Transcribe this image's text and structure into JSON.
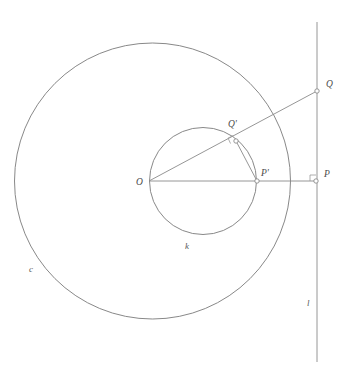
{
  "figure": {
    "background_color": "#ffffff",
    "stroke_color": "#7a7a7a",
    "label_color": "#4a4a4a",
    "width": 345,
    "height": 384
  },
  "labels": {
    "center": "O",
    "p_prime": "P'",
    "p": "P",
    "q_prime": "Q'",
    "q": "Q",
    "circle_c": "c",
    "circle_k": "k",
    "line_l": "l"
  },
  "geometry": {
    "circle_c": {
      "cx": 152.5,
      "cy": 181,
      "r": 138,
      "label": "c",
      "label_x": 29,
      "label_y": 272
    },
    "circle_k": {
      "cx": 203,
      "cy": 181,
      "r": 53.5,
      "label": "k",
      "label_x": 185,
      "label_y": 249
    },
    "line_l": {
      "x": 317,
      "y1": 22,
      "y2": 362,
      "label": "l",
      "label_x": 307,
      "label_y": 306
    },
    "points": [
      {
        "name": "O",
        "x": 149,
        "y": 181,
        "label": "O",
        "label_x": 136,
        "label_y": 185,
        "marker": "vertex"
      },
      {
        "name": "P'",
        "x": 257,
        "y": 181,
        "label": "P'",
        "label_x": 261,
        "label_y": 176,
        "marker": "open"
      },
      {
        "name": "P",
        "x": 316,
        "y": 181,
        "label": "P",
        "label_x": 324,
        "label_y": 177,
        "marker": "open"
      },
      {
        "name": "Q'",
        "x": 236,
        "y": 141,
        "label": "Q'",
        "label_x": 228,
        "label_y": 127,
        "marker": "open"
      },
      {
        "name": "Q",
        "x": 317,
        "y": 91,
        "label": "Q",
        "label_x": 326,
        "label_y": 87,
        "marker": "open"
      }
    ],
    "segments": [
      {
        "name": "ray-OP",
        "x1": 149,
        "y1": 181,
        "x2": 316,
        "y2": 181
      },
      {
        "name": "ray-OQ",
        "x1": 149,
        "y1": 181,
        "x2": 317,
        "y2": 91
      },
      {
        "name": "chord-QP",
        "x1": 236,
        "y1": 141,
        "x2": 257,
        "y2": 181
      }
    ],
    "right_angles": [
      {
        "name": "right-angle-at-q-prime",
        "x": 236,
        "y": 141,
        "size": 6,
        "rotation": -25
      },
      {
        "name": "right-angle-at-p",
        "x": 316,
        "y": 181,
        "size": 6,
        "rotation": 0
      }
    ]
  }
}
